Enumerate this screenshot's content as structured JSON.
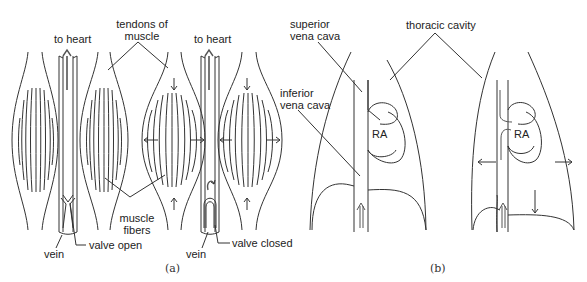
{
  "header": {
    "text": "..."
  },
  "panel_a": {
    "caption": "(a)",
    "labels": {
      "to_heart_left": "to heart",
      "to_heart_right": "to heart",
      "tendons_line1": "tendons of",
      "tendons_line2": "muscle",
      "muscle_fibers_line1": "muscle",
      "muscle_fibers_line2": "fibers",
      "vein_left": "vein",
      "vein_right": "vein",
      "valve_open": "valve open",
      "valve_closed": "valve closed"
    }
  },
  "panel_b": {
    "caption": "(b)",
    "labels": {
      "superior_line1": "superior",
      "superior_line2": "vena cava",
      "inferior_line1": "inferior",
      "inferior_line2": "vena cava",
      "thoracic_cavity": "thoracic cavity",
      "ra_left": "RA",
      "ra_right": "RA"
    }
  },
  "colors": {
    "line": "#333333",
    "background": "#ffffff"
  }
}
